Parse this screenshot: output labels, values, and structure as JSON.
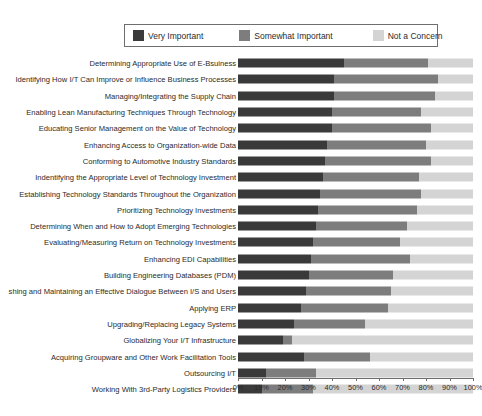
{
  "chart_data": {
    "type": "bar",
    "orientation": "horizontal",
    "stacked": true,
    "title": "",
    "subtitle": "",
    "xlabel": "",
    "ylabel": "",
    "xlim": [
      0,
      100
    ],
    "xtick_labels": [
      "0%",
      "10%",
      "20%",
      "30%",
      "40%",
      "50%",
      "60%",
      "70%",
      "80%",
      "90%",
      "100%"
    ],
    "xtick_values": [
      0,
      10,
      20,
      30,
      40,
      50,
      60,
      70,
      80,
      90,
      100
    ],
    "grid": false,
    "legend_position": "top",
    "legend": [
      {
        "name": "Very Important",
        "color": "#3a3a3a"
      },
      {
        "name": "Somewhat Important",
        "color": "#7d7d7d"
      },
      {
        "name": "Not a Concern",
        "color": "#d4d4d4"
      }
    ],
    "categories": [
      "Determining Appropriate Use of E-Bsuiness",
      "Identifying How I/T Can Improve or Influence Business Processes",
      "Managing/Integrating the Supply Chain",
      "Enabling Lean Manufacturing Techniques Through Technology",
      "Educating Senior Management on the Value of Technology",
      "Enhancing Access to Organization-wide Data",
      "Conforming to Automotive Industry Standards",
      "Indentifying the Appropriate Level of Technology Investment",
      "Establishing Technology Standards Throughout the Organization",
      "Prioritizing Technology Investments",
      "Determining When and How to Adopt Emerging Technologies",
      "Evaluating/Measuring Return on Technology Investments",
      "Enhancing EDI Capabilities",
      "Building Engineering Databases (PDM)",
      "shing and Maintaining an Effective Dialogue Between I/S and Users",
      "Applying ERP",
      "Upgrading/Replacing Legacy Systems",
      "Globalizing Your I/T Infrastructure",
      "Acquiring Groupware and Other Work Facilitation Tools",
      "Outsourcing I/T",
      "Working With 3rd-Party Logistics Providers"
    ],
    "series": [
      {
        "name": "Very Important",
        "color": "#3a3a3a",
        "values": [
          45,
          41,
          41,
          40,
          40,
          38,
          37,
          36,
          35,
          34,
          33,
          32,
          31,
          30,
          29,
          27,
          24,
          19,
          28,
          12,
          10
        ]
      },
      {
        "name": "Somewhat Important",
        "color": "#7d7d7d",
        "values": [
          36,
          44,
          43,
          38,
          42,
          42,
          45,
          41,
          43,
          42,
          39,
          37,
          42,
          36,
          36,
          37,
          30,
          4,
          28,
          21,
          22
        ]
      },
      {
        "name": "Not a Concern",
        "color": "#d4d4d4",
        "values": [
          19,
          15,
          16,
          22,
          18,
          20,
          18,
          23,
          22,
          24,
          28,
          31,
          27,
          34,
          35,
          36,
          46,
          77,
          44,
          67,
          68
        ]
      }
    ]
  }
}
